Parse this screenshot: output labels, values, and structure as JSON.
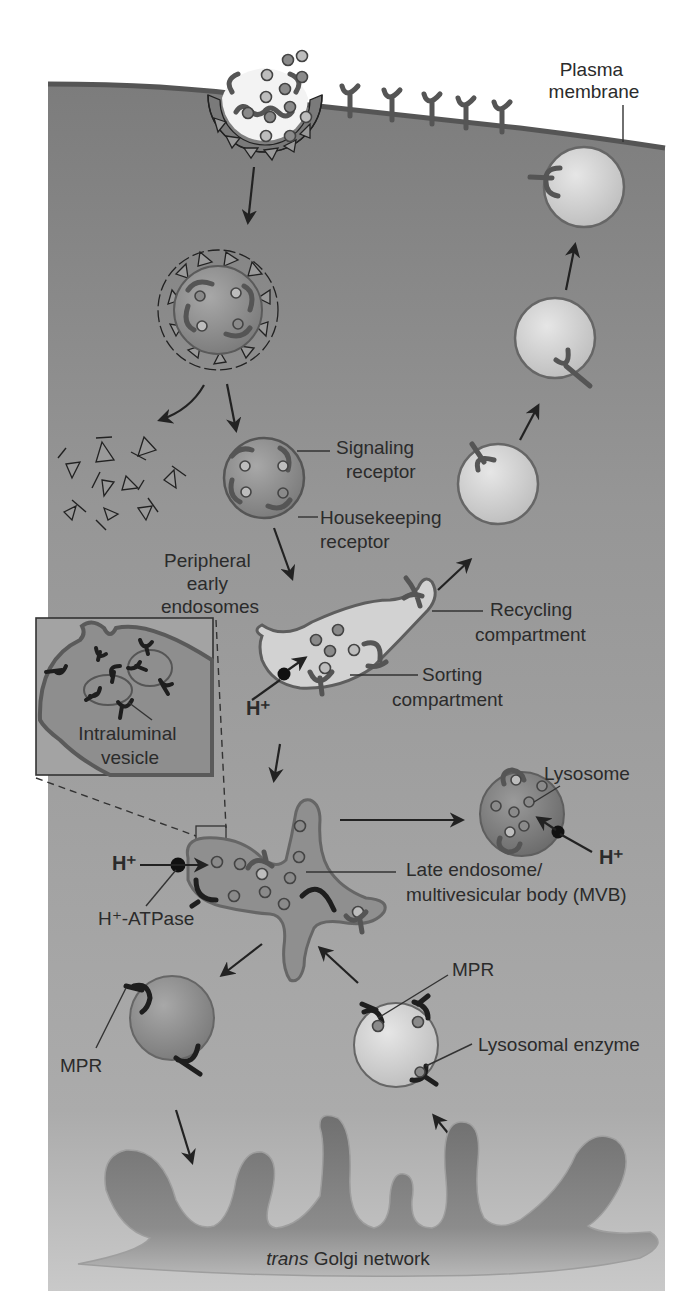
{
  "figure": {
    "panel_label": "(a)",
    "colors": {
      "cytoplasm": "#8f8f8f",
      "cytoplasm_light": "#a9a9a9",
      "membrane": "#6a6a6a",
      "vesicle_light": "#d4d4d4",
      "organelle_mid": "#7d7d7d",
      "ink": "#2b2b2b"
    }
  },
  "labels": {
    "plasma_membrane": [
      "Plasma",
      "membrane"
    ],
    "signaling_receptor": [
      "Signaling",
      "receptor"
    ],
    "housekeeping_receptor": [
      "Housekeeping",
      "receptor"
    ],
    "peripheral_early_endosomes": [
      "Peripheral",
      "early",
      "endosomes"
    ],
    "recycling_compartment": [
      "Recycling",
      "compartment"
    ],
    "sorting_compartment": [
      "Sorting",
      "compartment"
    ],
    "h_plus_early": "H⁺",
    "intraluminal_vesicle": [
      "Intraluminal",
      "vesicle"
    ],
    "lysosome": "Lysosome",
    "h_plus_lysosome": "H⁺",
    "h_plus_late": "H⁺",
    "h_plus_atpase": "H⁺-ATPase",
    "late_endosome": [
      "Late endosome/",
      "multivesicular body (MVB)"
    ],
    "mpr_right": "MPR",
    "mpr_left": "MPR",
    "lysosomal_enzyme": "Lysosomal enzyme",
    "trans_golgi": {
      "italic": "trans",
      "rest": " Golgi network"
    }
  }
}
